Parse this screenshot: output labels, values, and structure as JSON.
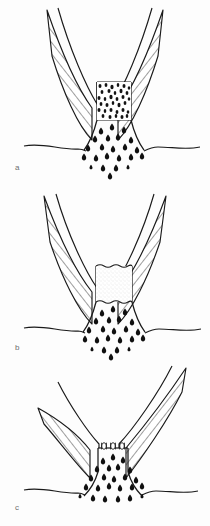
{
  "figure": {
    "kind": "medical-line-drawing",
    "background_color": "#fdfdfd",
    "ink_color": "#1a1a1a",
    "label_color": "#6e6e6e",
    "panels": [
      {
        "id": "a",
        "label": "a",
        "label_x": 15,
        "label_y": 164,
        "center_fill": "dark-granular",
        "center_fill_description": "neck packed with dense dark granules",
        "has_clips": false,
        "clip_count": 0,
        "spray_particle_count": 22
      },
      {
        "id": "b",
        "label": "b",
        "label_x": 15,
        "label_y": 344,
        "center_fill": "pale-stipple",
        "center_fill_description": "neck filled with a pale stippled plug",
        "has_clips": false,
        "clip_count": 0,
        "spray_particle_count": 22
      },
      {
        "id": "c",
        "label": "c",
        "label_x": 15,
        "label_y": 504,
        "center_fill": "open",
        "center_fill_description": "neck closed by a row of surgical clips",
        "has_clips": true,
        "clip_count": 3,
        "spray_particle_count": 24
      }
    ],
    "caption_partial": ""
  }
}
